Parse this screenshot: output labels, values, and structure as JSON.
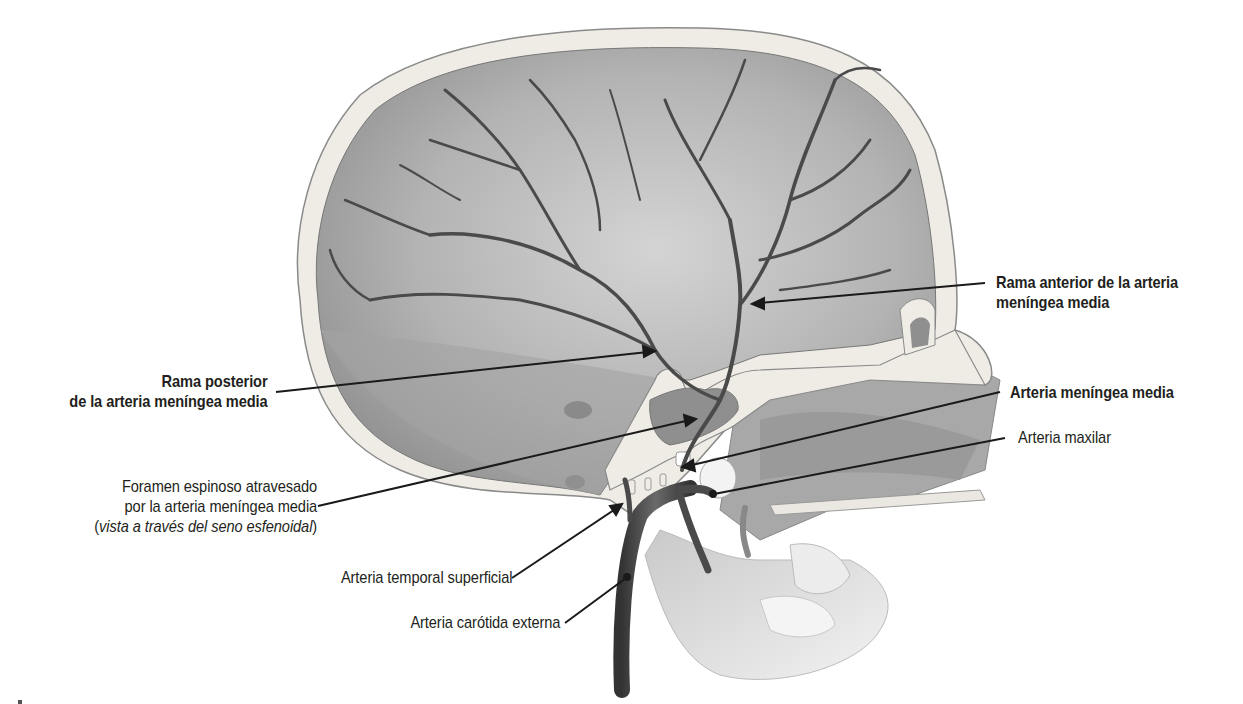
{
  "figure": {
    "labels": {
      "rama_anterior": {
        "line1": "Rama anterior de la arteria",
        "line2": "meníngea media"
      },
      "rama_posterior": {
        "line1": "Rama posterior",
        "line2": "de la arteria meníngea media"
      },
      "arteria_meningea_media": "Arteria meníngea media",
      "arteria_maxilar": "Arteria maxilar",
      "foramen_espinoso": {
        "line1": "Foramen espinoso atravesado",
        "line2": "por la arteria meníngea media",
        "line3_open": "(",
        "line3_italic": "vista a través del seno esfenoidal",
        "line3_close": ")"
      },
      "arteria_temporal_superficial": "Arteria temporal superficial",
      "arteria_carotida_externa": "Arteria carótida externa"
    },
    "colors": {
      "bone": "#efece6",
      "bone_outline": "#8a8a8a",
      "cranial_cavity": "#b4b4b4",
      "vessel": "#4a4a4a",
      "leader_line": "#1a1a1a",
      "text": "#231f20"
    }
  }
}
